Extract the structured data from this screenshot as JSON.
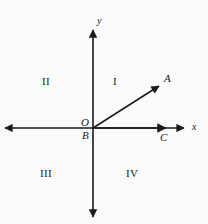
{
  "figure": {
    "kind": "coordinate-plane-diagram",
    "background_color": "#fbfbfb",
    "ink_color": "#1a1a1a",
    "width": 208,
    "height": 224
  },
  "axes": {
    "x_label": "x",
    "y_label": "y",
    "origin_label": "O",
    "x_arrow_both_ends": true,
    "y_arrow_both_ends": true
  },
  "quadrants": [
    {
      "id": "I",
      "label": "I"
    },
    {
      "id": "II",
      "label": "II"
    },
    {
      "id": "III",
      "label": "III"
    },
    {
      "id": "IV",
      "label": "IV"
    }
  ],
  "points": [
    {
      "id": "A",
      "label": "A"
    },
    {
      "id": "B",
      "label": "B"
    },
    {
      "id": "C",
      "label": "C"
    },
    {
      "id": "O",
      "label": "O"
    }
  ],
  "rays": [
    {
      "id": "OA",
      "from": "O",
      "to": "A",
      "arrow": true
    },
    {
      "id": "OC",
      "from": "O",
      "to": "C",
      "arrow": true
    }
  ],
  "geometry": {
    "origin": {
      "x": 93,
      "y": 128
    },
    "x_axis": {
      "x1": 3,
      "y1": 128,
      "x2": 186,
      "y2": 128
    },
    "y_axis": {
      "x1": 93,
      "y1": 28,
      "x2": 93,
      "y2": 219
    },
    "ray_oa": {
      "x1": 93,
      "y1": 128,
      "x2": 161,
      "y2": 85
    },
    "ray_oc": {
      "x1": 93,
      "y1": 128,
      "x2": 168,
      "y2": 128
    },
    "label_positions": {
      "y": {
        "left": 97,
        "top": 16
      },
      "x": {
        "left": 192,
        "top": 122
      },
      "O": {
        "left": 81,
        "top": 118
      },
      "B": {
        "left": 81,
        "top": 131
      },
      "A": {
        "left": 164,
        "top": 74
      },
      "C": {
        "left": 160,
        "top": 132
      },
      "I": {
        "left": 113,
        "top": 76
      },
      "II": {
        "left": 42,
        "top": 76
      },
      "III": {
        "left": 41,
        "top": 168
      },
      "IV": {
        "left": 127,
        "top": 168
      }
    }
  }
}
